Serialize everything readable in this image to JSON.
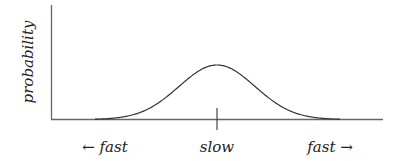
{
  "diagram": {
    "y_axis_label": "probability",
    "x_labels": {
      "left": "← fast",
      "center": "slow",
      "right": "fast →"
    }
  },
  "chart_data": {
    "type": "line",
    "title": "",
    "xlabel": "",
    "ylabel": "probability",
    "x_tick_labels": [
      "← fast",
      "slow",
      "fast →"
    ],
    "series": [
      {
        "name": "bell curve (normal distribution)",
        "shape": "gaussian",
        "peak_at": "slow"
      }
    ],
    "grid": false,
    "legend": "none"
  },
  "colors": {
    "axis": "#555555",
    "curve": "#333333",
    "text": "#222222",
    "background": "#ffffff"
  }
}
